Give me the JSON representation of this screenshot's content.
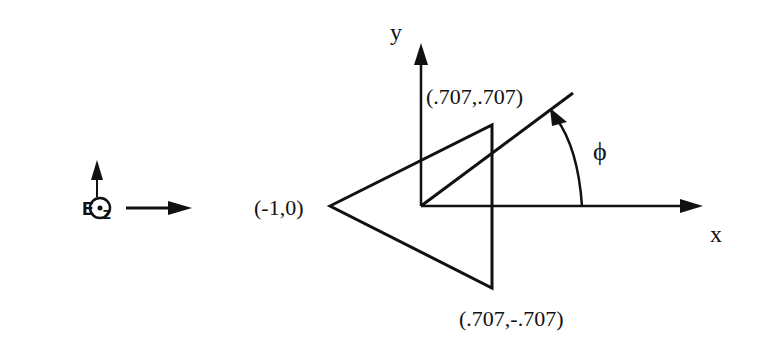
{
  "legend": {
    "field_label": "E",
    "field_subscript": "z",
    "out_of_page_symbol": "dot-in-circle"
  },
  "axes": {
    "x_label": "x",
    "y_label": "y"
  },
  "angle": {
    "label": "ϕ"
  },
  "vertices": {
    "left": "(-1,0)",
    "top": "(.707,.707)",
    "bottom": "(.707,-.707)"
  },
  "colors": {
    "stroke": "#111111",
    "background": "#ffffff"
  }
}
